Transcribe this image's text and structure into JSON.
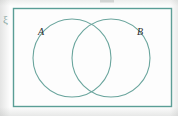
{
  "figure": {
    "type": "venn-diagram",
    "universal_set_symbol": "ξ",
    "stroke_color": "#5a9e96",
    "label_color": "#2e2e2e",
    "background_color": "#fdfdfd",
    "width": 178,
    "height": 116
  },
  "universal_set": {
    "name": "universal-set-rectangle",
    "symbol": "ξ",
    "x": 13,
    "y": 8,
    "width": 159,
    "height": 99
  },
  "sets": [
    {
      "label": "A",
      "name": "set-a",
      "center_x": 72,
      "center_y": 58,
      "radius": 39,
      "label_x": 38,
      "label_y": 35
    },
    {
      "label": "B",
      "name": "set-b",
      "center_x": 111,
      "center_y": 58,
      "radius": 39,
      "label_x": 137,
      "label_y": 35
    }
  ],
  "artifacts": {
    "top_crop_mark": ""
  }
}
